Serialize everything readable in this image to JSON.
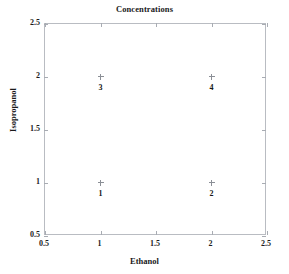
{
  "chart_data": {
    "type": "scatter",
    "title": "Concentrations",
    "xlabel": "Ethanol",
    "ylabel": "Isopropanol",
    "xlim": [
      0.5,
      2.5
    ],
    "ylim": [
      0.5,
      2.5
    ],
    "xticks": [
      "0.5",
      "1",
      "1.5",
      "2",
      "2.5"
    ],
    "xtick_values": [
      0.5,
      1,
      1.5,
      2,
      2.5
    ],
    "yticks": [
      "0.5",
      "1",
      "1.5",
      "2",
      "2.5"
    ],
    "ytick_values": [
      0.5,
      1,
      1.5,
      2,
      2.5
    ],
    "grid": false,
    "legend": "none",
    "marker": "plus",
    "points": [
      {
        "label": "1",
        "x": 1,
        "y": 1
      },
      {
        "label": "2",
        "x": 2,
        "y": 1
      },
      {
        "label": "3",
        "x": 1,
        "y": 2
      },
      {
        "label": "4",
        "x": 2,
        "y": 2
      }
    ]
  },
  "colors": {
    "frame": "#b9bcc2",
    "marker": "#8b8f96",
    "text": "#1a1a1a",
    "background": "#ffffff"
  }
}
